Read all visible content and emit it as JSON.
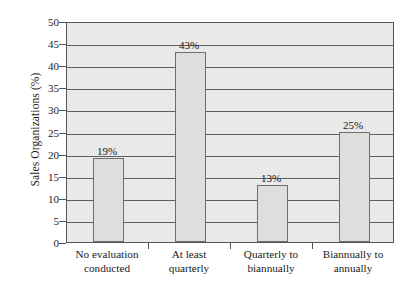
{
  "chart_data": {
    "type": "bar",
    "title": "",
    "xlabel": "",
    "ylabel": "Sales Organizations (%)",
    "categories": [
      "No evaluation conducted",
      "At least quarterly",
      "Quarterly to biannually",
      "Biannually to annually"
    ],
    "category_lines": [
      [
        "No evaluation",
        "conducted"
      ],
      [
        "At least",
        "quarterly"
      ],
      [
        "Quarterly to",
        "biannually"
      ],
      [
        "Biannually to",
        "annually"
      ]
    ],
    "values": [
      19,
      43,
      13,
      25
    ],
    "value_labels": [
      "19%",
      "43%",
      "13%",
      "25%"
    ],
    "ylim": [
      0,
      50
    ],
    "ytick_values": [
      0,
      5,
      10,
      15,
      20,
      25,
      30,
      35,
      40,
      45,
      50
    ],
    "ytick_labels": [
      "0",
      "5",
      "10",
      "15",
      "20",
      "25",
      "30",
      "35",
      "40",
      "45",
      "50"
    ],
    "grid": true,
    "legend": "none",
    "colors": {
      "bar_fill": "#dedede",
      "bar_edge": "#6e6e6e",
      "plot_background": "#e9e9e9",
      "axis": "#555555",
      "gridline": "#5f5f5f",
      "figure_background": "#ffffff",
      "text": "#1a1a1a"
    }
  }
}
